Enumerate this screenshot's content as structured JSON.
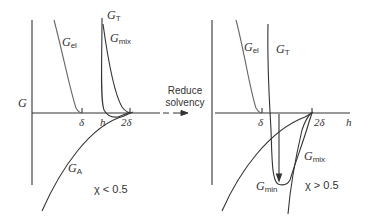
{
  "figure": {
    "arrow_label": [
      "Reduce",
      "solvency"
    ],
    "left_panel": {
      "y_axis_label": "G",
      "curves": [
        {
          "name": "G_el",
          "symbol": "G",
          "subscript": "el"
        },
        {
          "name": "G_T",
          "symbol": "G",
          "subscript": "T"
        },
        {
          "name": "G_mix",
          "symbol": "G",
          "subscript": "mix"
        },
        {
          "name": "G_A",
          "symbol": "G",
          "subscript": "A"
        }
      ],
      "x_ticks": [
        "δ",
        "h",
        "2δ"
      ],
      "condition": "χ < 0.5"
    },
    "right_panel": {
      "x_axis_label": "h",
      "curves": [
        {
          "name": "G_el",
          "symbol": "G",
          "subscript": "el"
        },
        {
          "name": "G_T",
          "symbol": "G",
          "subscript": "T"
        },
        {
          "name": "G_mix",
          "symbol": "G",
          "subscript": "mix"
        },
        {
          "name": "G_min",
          "symbol": "G",
          "subscript": "min"
        }
      ],
      "x_ticks": [
        "δ",
        "2δ"
      ],
      "condition": "χ > 0.5"
    },
    "colors": {
      "line": "#333333",
      "light_line": "#555555",
      "background": "#ffffff"
    }
  }
}
